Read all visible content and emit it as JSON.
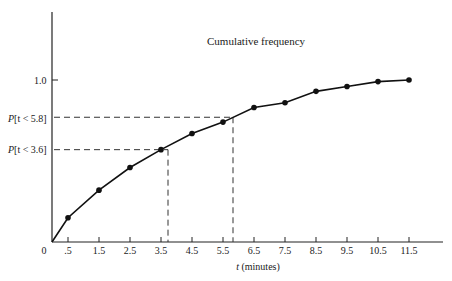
{
  "chart_data": {
    "type": "line",
    "title": "Cumulative frequency",
    "xlabel_var": "t",
    "xlabel_unit": "(minutes)",
    "ylabel": "",
    "x_tick_labels": [
      "0",
      ".5",
      "1.5",
      "2.5",
      "3.5",
      "4.5",
      "5.5",
      "6.5",
      "7.5",
      "8.5",
      "9.5",
      "10.5",
      "11.5"
    ],
    "y_tick_labels": [
      "1.0"
    ],
    "x": [
      0,
      0.5,
      1.5,
      2.5,
      3.5,
      4.5,
      5.5,
      6.5,
      7.5,
      8.5,
      9.5,
      10.5,
      11.5
    ],
    "values": [
      0,
      0.15,
      0.32,
      0.46,
      0.57,
      0.67,
      0.74,
      0.83,
      0.86,
      0.93,
      0.96,
      0.99,
      1.0
    ],
    "markers": true,
    "annotations": [
      {
        "label": "P[t < 5.8]",
        "x": 5.8,
        "y": 0.77
      },
      {
        "label": "P[t < 3.6]",
        "x": 3.6,
        "y": 0.57
      }
    ],
    "xlim": [
      0,
      12.5
    ],
    "ylim": [
      0,
      1.4
    ],
    "grid": false,
    "legend": "none"
  }
}
